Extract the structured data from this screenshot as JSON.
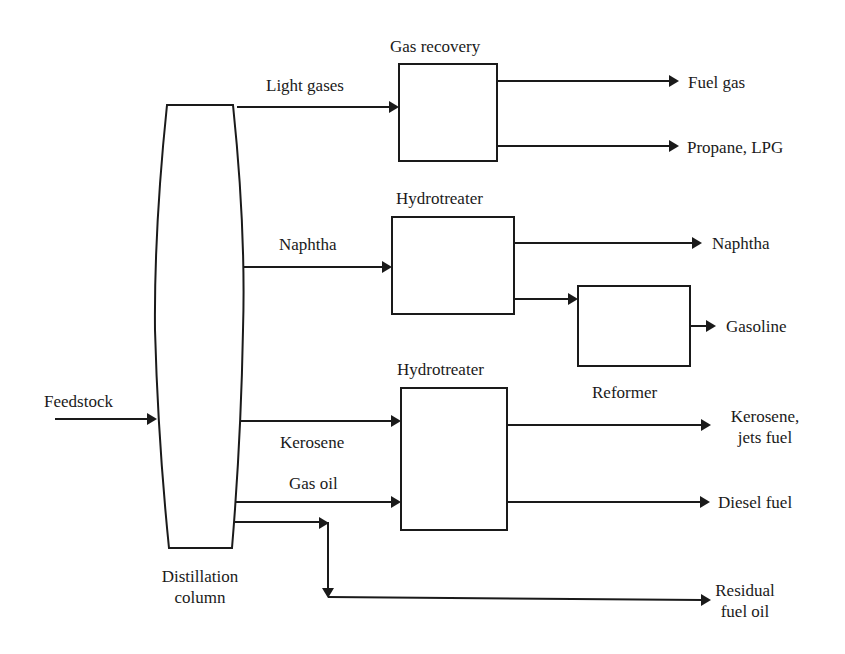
{
  "diagram": {
    "type": "process-flow",
    "feed": {
      "label": "Feedstock"
    },
    "column": {
      "label_line1": "Distillation",
      "label_line2": "column"
    },
    "units": {
      "gas_recovery": {
        "label": "Gas recovery"
      },
      "hydrotreater_1": {
        "label": "Hydrotreater"
      },
      "reformer": {
        "label": "Reformer"
      },
      "hydrotreater_2": {
        "label": "Hydrotreater"
      }
    },
    "streams": {
      "light_gases": "Light gases",
      "naphtha_in": "Naphtha",
      "kerosene_in": "Kerosene",
      "gas_oil": "Gas oil"
    },
    "products": {
      "fuel_gas": "Fuel gas",
      "propane_lpg": "Propane, LPG",
      "naphtha": "Naphtha",
      "gasoline": "Gasoline",
      "kerosene_line1": "Kerosene,",
      "kerosene_line2": "jets fuel",
      "diesel": "Diesel fuel",
      "residual_line1": "Residual",
      "residual_line2": "fuel oil"
    },
    "colors": {
      "line": "#1a1a1a",
      "background": "#ffffff"
    }
  }
}
